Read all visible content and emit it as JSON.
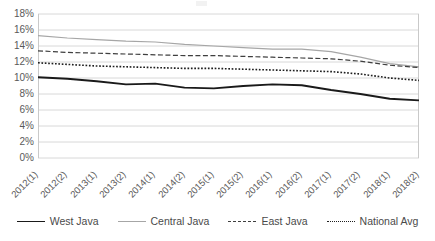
{
  "chart_data": {
    "type": "line",
    "title": "",
    "xlabel": "",
    "ylabel": "",
    "ylim": [
      0,
      18
    ],
    "ytick_step": 2,
    "grid": true,
    "legend_position": "bottom",
    "categories": [
      "2012(1)",
      "2012(2)",
      "2013(1)",
      "2013(2)",
      "2014(1)",
      "2014(2)",
      "2015(1)",
      "2015(2)",
      "2016(1)",
      "2016(2)",
      "2017(1)",
      "2017(2)",
      "2018(1)",
      "2018(2)"
    ],
    "ytick_labels": [
      "18%",
      "16%",
      "14%",
      "12%",
      "10%",
      "8%",
      "6%",
      "4%",
      "2%",
      "0%"
    ],
    "series": [
      {
        "name": "West Java",
        "style": "solid",
        "color": "#1a1a1a",
        "width": 1.9,
        "values": [
          10.1,
          9.9,
          9.6,
          9.2,
          9.3,
          8.8,
          8.7,
          9.0,
          9.2,
          9.1,
          8.5,
          8.0,
          7.4,
          7.2
        ]
      },
      {
        "name": "Central Java",
        "style": "solid",
        "color": "#a6a6a6",
        "width": 1.2,
        "values": [
          15.3,
          15.0,
          14.8,
          14.6,
          14.5,
          14.2,
          14.0,
          13.8,
          13.6,
          13.6,
          13.3,
          12.6,
          11.8,
          11.4
        ]
      },
      {
        "name": "East Java",
        "style": "dashed",
        "color": "#3f3f3f",
        "width": 1.2,
        "values": [
          13.4,
          13.2,
          13.1,
          13.0,
          12.9,
          12.8,
          12.8,
          12.7,
          12.6,
          12.5,
          12.4,
          12.1,
          11.6,
          11.3
        ]
      },
      {
        "name": "National Avg",
        "style": "dotted",
        "color": "#1f1f1f",
        "width": 1.6,
        "values": [
          11.9,
          11.7,
          11.5,
          11.4,
          11.3,
          11.2,
          11.2,
          11.1,
          11.0,
          10.9,
          10.8,
          10.5,
          10.0,
          9.7
        ]
      }
    ]
  },
  "legend": {
    "items": [
      {
        "label": "West Java"
      },
      {
        "label": "Central Java"
      },
      {
        "label": "East Java"
      },
      {
        "label": "National Avg"
      }
    ]
  }
}
